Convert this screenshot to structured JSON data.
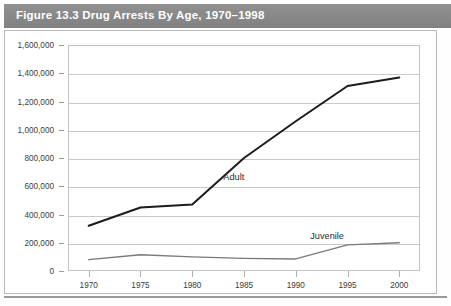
{
  "figure": {
    "title": "Figure 13.3  Drug Arrests By Age, 1970–1998"
  },
  "chart_data": {
    "type": "line",
    "title": "Figure 13.3  Drug Arrests By Age, 1970–1998",
    "xlabel": "",
    "ylabel": "",
    "grid": true,
    "legend_position": "inline-annotation",
    "x": [
      1970,
      1975,
      1980,
      1985,
      1990,
      1995,
      2000
    ],
    "xlim": [
      1968,
      2002
    ],
    "ylim": [
      0,
      1600000
    ],
    "ytick_labels": [
      "1,600,000",
      "1,400,000",
      "1,200,000",
      "1,000,000",
      "800,000",
      "600,000",
      "400,000",
      "200,000",
      "0"
    ],
    "ytick_values": [
      1600000,
      1400000,
      1200000,
      1000000,
      800000,
      600000,
      400000,
      200000,
      0
    ],
    "xtick_labels": [
      "1970",
      "1975",
      "1980",
      "1985",
      "1990",
      "1995",
      "2000"
    ],
    "series": [
      {
        "name": "Adult",
        "color": "#1c1c1c",
        "width": 2.0,
        "values": [
          320000,
          450000,
          470000,
          800000,
          1060000,
          1310000,
          1370000
        ],
        "label_x": 1983.0,
        "label_y": 700000
      },
      {
        "name": "Juvenile",
        "color": "#7a7a7a",
        "width": 1.3,
        "values": [
          80000,
          115000,
          100000,
          90000,
          85000,
          185000,
          200000
        ],
        "label_x": 1991.4,
        "label_y": 285000
      }
    ]
  }
}
